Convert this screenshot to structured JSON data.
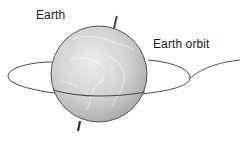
{
  "diagram": {
    "labels": {
      "earth": "Earth",
      "orbit": "Earth orbit"
    },
    "elements": {
      "globe": {
        "cx": 99,
        "cy": 74,
        "r": 48,
        "fill_light": "#e8e8e8",
        "fill_dark": "#a9a9a9",
        "stroke": "#555555"
      },
      "orbit": {
        "stroke": "#4a4a4a"
      },
      "axis": {
        "stroke": "#333333"
      }
    }
  }
}
